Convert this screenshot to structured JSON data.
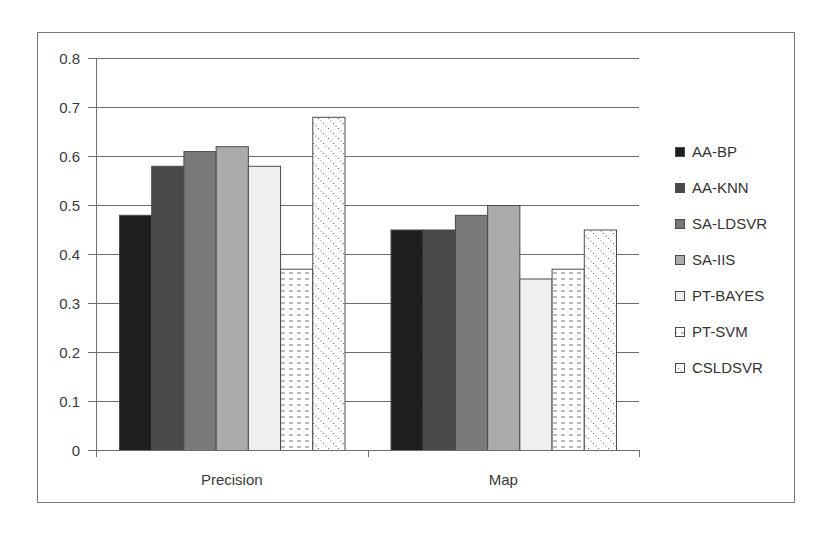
{
  "chart_data": {
    "type": "bar",
    "title": "",
    "xlabel": "",
    "ylabel": "",
    "categories": [
      "Precision",
      "Map"
    ],
    "ylim": [
      0,
      0.8
    ],
    "yticks": [
      0,
      0.1,
      0.2,
      0.3,
      0.4,
      0.5,
      0.6,
      0.7,
      0.8
    ],
    "ytick_labels": [
      "0",
      "0.1",
      "0.2",
      "0.3",
      "0.4",
      "0.5",
      "0.6",
      "0.7",
      "0.8"
    ],
    "grid": true,
    "legend_position": "right",
    "series": [
      {
        "name": "AA-BP",
        "values": [
          0.48,
          0.45
        ],
        "color": "#1e1e1e",
        "pattern": "solid"
      },
      {
        "name": "AA-KNN",
        "values": [
          0.58,
          0.45
        ],
        "color": "#4a4a4a",
        "pattern": "solid"
      },
      {
        "name": "SA-LDSVR",
        "values": [
          0.61,
          0.48
        ],
        "color": "#7a7a7a",
        "pattern": "solid"
      },
      {
        "name": "SA-IIS",
        "values": [
          0.62,
          0.5
        ],
        "color": "#ababab",
        "pattern": "solid"
      },
      {
        "name": "PT-BAYES",
        "values": [
          0.58,
          0.35
        ],
        "color": "#efefef",
        "pattern": "solid"
      },
      {
        "name": "PT-SVM",
        "values": [
          0.37,
          0.37
        ],
        "color": "#ffffff",
        "pattern": "horizontal-dashes"
      },
      {
        "name": "CSLDSVR",
        "values": [
          0.68,
          0.45
        ],
        "color": "#ffffff",
        "pattern": "diagonal-dots"
      }
    ]
  }
}
